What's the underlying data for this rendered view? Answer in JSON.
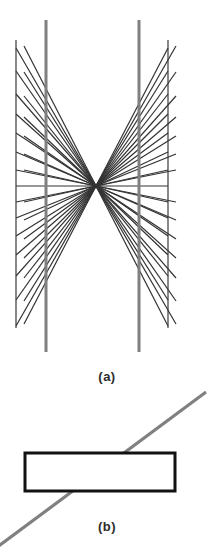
{
  "page": {
    "background_color": "#ffffff",
    "width": 214,
    "height": 555
  },
  "captions": {
    "a": "(a)",
    "b": "(b)"
  },
  "colors": {
    "thin_line": "#3a3a3a",
    "thick_gray_line": "#808080",
    "ray_line": "#333333",
    "rectangle_stroke": "#111111",
    "diagonal_line": "#808080",
    "caption_text": "#2b2b2b"
  },
  "chart_data": {
    "type": "diagram",
    "title": "",
    "panels": [
      {
        "label": "(a)",
        "name": "hering-illusion-panel",
        "description": "Two straight vertical gray lines crossed by a fan of rays radiating from a central vanishing point, plus two thin outer vertical lines and one horizontal line through the center.",
        "vanishing_point": {
          "x": 96,
          "y": 186
        },
        "thin_vertical_lines": [
          {
            "x": 16,
            "y1": 40,
            "y2": 328
          },
          {
            "x": 168,
            "y1": 40,
            "y2": 328
          }
        ],
        "thick_vertical_lines": [
          {
            "x": 46,
            "y1": 20,
            "y2": 352
          },
          {
            "x": 139,
            "y1": 20,
            "y2": 352
          }
        ],
        "horizontal_line": {
          "x1": 16,
          "x2": 168,
          "y": 186
        },
        "ray_count_per_side": 13,
        "ray_left_endpoints_y": [
          48,
          71,
          94,
          114,
          133,
          152,
          170,
          186,
          202,
          218,
          236,
          255,
          276,
          300,
          326
        ],
        "ray_right_endpoints_y": [
          48,
          71,
          94,
          114,
          133,
          152,
          170,
          186,
          202,
          218,
          236,
          255,
          276,
          300,
          326
        ],
        "ray_left_endpoint_x": 16,
        "ray_right_endpoint_x": 168,
        "line_widths": {
          "thin": 1.2,
          "thick": 3.0,
          "ray": 1.2
        }
      },
      {
        "label": "(b)",
        "name": "poggendorff-illusion-panel",
        "description": "A thin-outlined horizontal rectangle crossed by a single straight gray diagonal line running from lower-left to upper-right.",
        "rectangle": {
          "x": 25,
          "y": 453,
          "width": 150,
          "height": 38,
          "stroke_width": 3
        },
        "diagonal_line": {
          "x1": 206,
          "y1": 392,
          "x2": -4,
          "y2": 548,
          "stroke_width": 3.2
        }
      }
    ]
  }
}
